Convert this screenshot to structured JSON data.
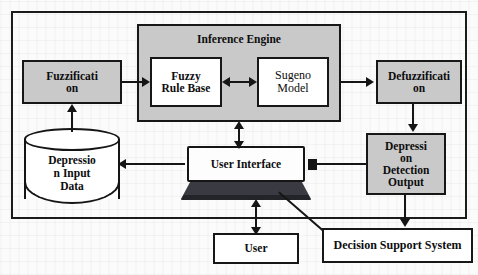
{
  "diagram": {
    "outer_frame": {
      "name": "system-boundary"
    },
    "nodes": {
      "fuzzification": {
        "label_line1": "Fuzzificati",
        "label_line2": "on",
        "fill": "#c9c9c9",
        "shape": "rectangle"
      },
      "inference_engine": {
        "label": "Inference Engine",
        "fill": "#c9c9c9",
        "shape": "container"
      },
      "fuzzy_rule_base": {
        "label_line1": "Fuzzy",
        "label_line2": "Rule Base",
        "fill": "#ffffff",
        "shape": "rectangle"
      },
      "sugeno_model": {
        "label_line1": "Sugeno",
        "label_line2": "Model",
        "fill": "#ffffff",
        "shape": "rectangle"
      },
      "defuzzification": {
        "label_line1": "Defuzzificati",
        "label_line2": "on",
        "fill": "#c9c9c9",
        "shape": "rectangle"
      },
      "depression_output": {
        "label_line1": "Depressi",
        "label_line2": "on",
        "label_line3": "Detection",
        "label_line4": "Output",
        "fill": "#c9c9c9",
        "shape": "rectangle"
      },
      "depression_input_data": {
        "label_line1": "Depressio",
        "label_line2": "n Input",
        "label_line3": "Data",
        "fill": "#ffffff",
        "shape": "cylinder"
      },
      "user_interface": {
        "label": "User Interface",
        "fill": "#fdfdfd",
        "shape": "laptop"
      },
      "user": {
        "label": "User",
        "fill": "#ffffff",
        "shape": "rectangle"
      },
      "decision_support_system": {
        "label": "Decision Support System",
        "fill": "#ffffff",
        "shape": "rectangle"
      }
    },
    "edges": [
      {
        "from": "depression_input_data",
        "to": "fuzzification",
        "type": "arrow-up"
      },
      {
        "from": "fuzzification",
        "to": "inference_engine",
        "type": "arrow-right"
      },
      {
        "from": "fuzzy_rule_base",
        "to": "sugeno_model",
        "type": "double-arrow"
      },
      {
        "from": "sugeno_model",
        "to": "defuzzification",
        "type": "arrow-right"
      },
      {
        "from": "defuzzification",
        "to": "depression_output",
        "type": "arrow-down"
      },
      {
        "from": "inference_engine",
        "to": "user_interface",
        "type": "double-arrow-vertical"
      },
      {
        "from": "user_interface",
        "to": "depression_input_data",
        "type": "arrow-left"
      },
      {
        "from": "depression_output",
        "to": "user_interface",
        "type": "line"
      },
      {
        "from": "depression_output",
        "to": "decision_support_system",
        "type": "arrow-down"
      },
      {
        "from": "user",
        "to": "user_interface",
        "type": "double-arrow-vertical"
      },
      {
        "from": "decision_support_system",
        "to": "user_interface",
        "type": "diagonal-line"
      }
    ],
    "colors": {
      "shaded_fill": "#c9c9c9",
      "white_fill": "#ffffff",
      "stroke": "#151515",
      "laptop_base": "#3a3a42",
      "background": "#fbfbfb"
    }
  }
}
